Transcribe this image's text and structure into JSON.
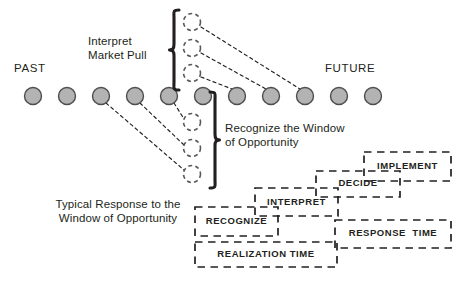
{
  "diagram": {
    "colors": {
      "ink": "#231f20",
      "node_fill": "#b3b3b3",
      "node_stroke": "#4d4d4d",
      "dashed_stroke": "#58595b",
      "box_stroke": "#231f20"
    },
    "era_labels": {
      "past": "PAST",
      "future": "FUTURE"
    },
    "annotations": {
      "interpret_market_pull": "Interpret\nMarket Pull",
      "recognize_window": "Recognize the Window\nof Opportunity",
      "typical_response": "Typical Response to the\nWindow of Opportunity"
    },
    "timeline_nodes": [
      {
        "id": "n1",
        "cx": 33,
        "cy": 96,
        "r": 8.5,
        "state": "solid"
      },
      {
        "id": "n2",
        "cx": 67,
        "cy": 96,
        "r": 8.5,
        "state": "solid"
      },
      {
        "id": "n3",
        "cx": 101,
        "cy": 96,
        "r": 8.5,
        "state": "solid"
      },
      {
        "id": "n4",
        "cx": 135,
        "cy": 96,
        "r": 8.5,
        "state": "solid"
      },
      {
        "id": "n5",
        "cx": 169,
        "cy": 96,
        "r": 8.5,
        "state": "solid"
      },
      {
        "id": "n6",
        "cx": 203,
        "cy": 96,
        "r": 8.5,
        "state": "solid"
      },
      {
        "id": "n7",
        "cx": 237,
        "cy": 96,
        "r": 8.5,
        "state": "solid"
      },
      {
        "id": "n8",
        "cx": 271,
        "cy": 96,
        "r": 8.5,
        "state": "solid"
      },
      {
        "id": "n9",
        "cx": 305,
        "cy": 96,
        "r": 8.5,
        "state": "solid"
      },
      {
        "id": "n10",
        "cx": 339,
        "cy": 96,
        "r": 8.5,
        "state": "solid"
      },
      {
        "id": "n11",
        "cx": 373,
        "cy": 96,
        "r": 8.5,
        "state": "solid"
      }
    ],
    "ghost_nodes": [
      {
        "id": "g-up-1",
        "cx": 192,
        "cy": 22,
        "r": 8.5,
        "state": "dashed",
        "group": "above"
      },
      {
        "id": "g-up-2",
        "cx": 192,
        "cy": 48,
        "r": 8.5,
        "state": "dashed",
        "group": "above"
      },
      {
        "id": "g-up-3",
        "cx": 192,
        "cy": 73,
        "r": 8.5,
        "state": "dashed",
        "group": "above"
      },
      {
        "id": "g-dn-1",
        "cx": 192,
        "cy": 122,
        "r": 8.5,
        "state": "dashed",
        "group": "below"
      },
      {
        "id": "g-dn-2",
        "cx": 192,
        "cy": 148,
        "r": 8.5,
        "state": "dashed",
        "group": "below"
      },
      {
        "id": "g-dn-3",
        "cx": 192,
        "cy": 174,
        "r": 8.5,
        "state": "dashed",
        "group": "below"
      }
    ],
    "projection_lines": [
      {
        "from": "g-up-1",
        "to": "n9",
        "x1": 201,
        "y1": 27,
        "x2": 300,
        "y2": 89
      },
      {
        "from": "g-up-2",
        "to": "n8",
        "x1": 201,
        "y1": 53,
        "x2": 266,
        "y2": 89
      },
      {
        "from": "g-up-3",
        "to": "n7",
        "x1": 201,
        "y1": 77,
        "x2": 232,
        "y2": 89
      },
      {
        "from": "n3",
        "to": "g-dn-3",
        "x1": 106,
        "y1": 103,
        "x2": 184,
        "y2": 170
      },
      {
        "from": "n4",
        "to": "g-dn-2",
        "x1": 140,
        "y1": 103,
        "x2": 184,
        "y2": 145
      },
      {
        "from": "n5",
        "to": "g-dn-1",
        "x1": 174,
        "y1": 103,
        "x2": 184,
        "y2": 119
      }
    ],
    "braces": [
      {
        "id": "brace-upper",
        "label_ref": "interpret_market_pull",
        "x": 172,
        "top": 10,
        "bottom": 90,
        "direction": "left"
      },
      {
        "id": "brace-lower",
        "label_ref": "recognize_window",
        "x": 215,
        "top": 92,
        "bottom": 188,
        "direction": "right"
      }
    ],
    "phase_boxes": [
      {
        "id": "implement",
        "label": "IMPLEMENT",
        "x": 364,
        "y": 152,
        "w": 87,
        "h": 29,
        "text_align": "center"
      },
      {
        "id": "decide",
        "label": "DECIDE",
        "x": 316,
        "y": 171,
        "w": 84,
        "h": 26,
        "text_align": "center"
      },
      {
        "id": "interpret",
        "label": "INTERPRET",
        "x": 255,
        "y": 188,
        "w": 83,
        "h": 28,
        "text_align": "center"
      },
      {
        "id": "recognize",
        "label": "RECOGNIZE",
        "x": 195,
        "y": 207,
        "w": 83,
        "h": 29,
        "text_align": "center"
      },
      {
        "id": "realization-time",
        "label": "REALIZATION TIME",
        "x": 195,
        "y": 242,
        "w": 142,
        "h": 25,
        "text_align": "center"
      },
      {
        "id": "response-time",
        "label": "RESPONSE  TIME",
        "x": 335,
        "y": 220,
        "w": 116,
        "h": 28,
        "text_align": "center"
      }
    ]
  }
}
